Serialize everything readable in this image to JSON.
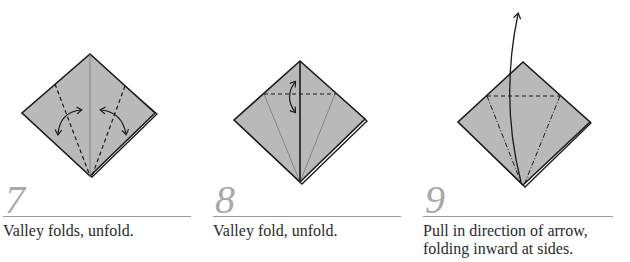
{
  "colors": {
    "paper": "#b9b9b9",
    "stroke": "#1a1a1a",
    "step_number": "#a8a8a8",
    "rule": "#9a9a9a"
  },
  "steps": [
    {
      "number": "7",
      "caption": "Valley folds, unfold.",
      "icons": [
        "valley-fold-line",
        "unfold-arrow"
      ]
    },
    {
      "number": "8",
      "caption": "Valley fold, unfold.",
      "icons": [
        "valley-fold-line",
        "unfold-arrow"
      ]
    },
    {
      "number": "9",
      "caption": "Pull in direction of arrow, folding inward at sides.",
      "caption_lines": [
        "Pull in direction of arrow,",
        "folding inward at sides."
      ],
      "icons": [
        "valley-fold-line",
        "mountain-fold-line",
        "pull-arrow"
      ]
    }
  ]
}
